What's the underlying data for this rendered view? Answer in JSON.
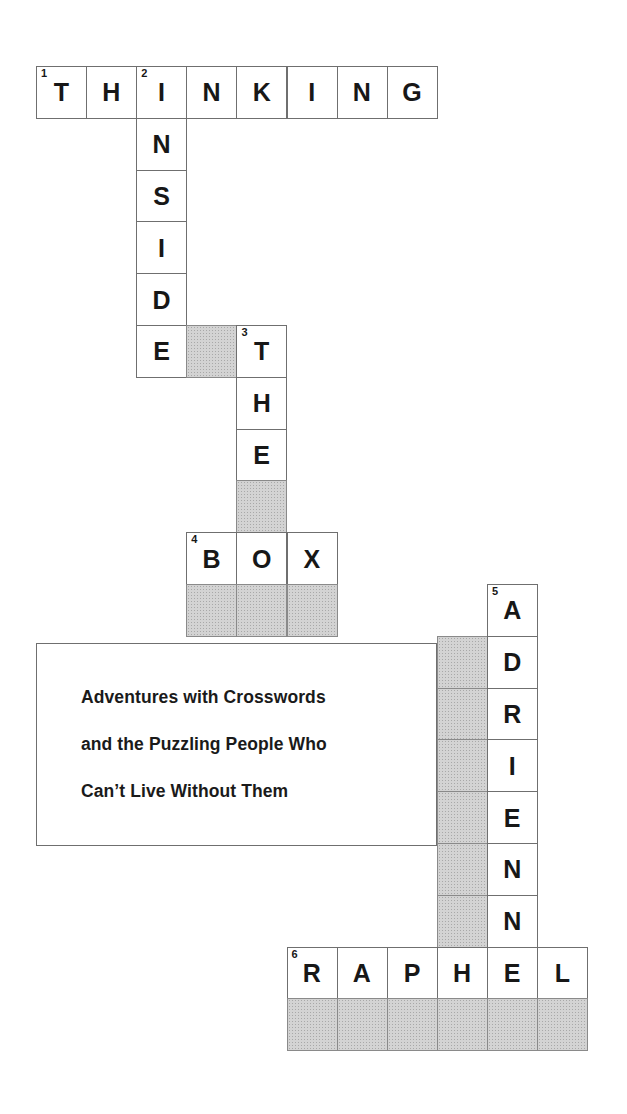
{
  "puzzle": {
    "title_answer_across_1": "THINKING",
    "geometry": {
      "origin_x": 36,
      "origin_y": 66,
      "col_width": 50.1,
      "row_height": 51.8
    },
    "entries": [
      {
        "number": "1",
        "direction": "across",
        "answer": "THINKING",
        "row": 0,
        "col": 0
      },
      {
        "number": "2",
        "direction": "down",
        "answer": "INSIDE",
        "row": 0,
        "col": 2
      },
      {
        "number": "3",
        "direction": "down",
        "answer": "THE",
        "row": 5,
        "col": 4
      },
      {
        "number": "4",
        "direction": "across",
        "answer": "BOX",
        "row": 9,
        "col": 3
      },
      {
        "number": "5",
        "direction": "down",
        "answer": "ADRIENN",
        "row": 10,
        "col": 9
      },
      {
        "number": "6",
        "direction": "across",
        "answer": "RAPHEL",
        "row": 17,
        "col": 5
      }
    ],
    "cells": [
      {
        "row": 0,
        "col": 0,
        "letter": "T",
        "number": "1",
        "shaded": false
      },
      {
        "row": 0,
        "col": 1,
        "letter": "H",
        "number": "",
        "shaded": false
      },
      {
        "row": 0,
        "col": 2,
        "letter": "I",
        "number": "2",
        "shaded": false
      },
      {
        "row": 0,
        "col": 3,
        "letter": "N",
        "number": "",
        "shaded": false
      },
      {
        "row": 0,
        "col": 4,
        "letter": "K",
        "number": "",
        "shaded": false
      },
      {
        "row": 0,
        "col": 5,
        "letter": "I",
        "number": "",
        "shaded": false
      },
      {
        "row": 0,
        "col": 6,
        "letter": "N",
        "number": "",
        "shaded": false
      },
      {
        "row": 0,
        "col": 7,
        "letter": "G",
        "number": "",
        "shaded": false
      },
      {
        "row": 1,
        "col": 2,
        "letter": "N",
        "number": "",
        "shaded": false
      },
      {
        "row": 2,
        "col": 2,
        "letter": "S",
        "number": "",
        "shaded": false
      },
      {
        "row": 3,
        "col": 2,
        "letter": "I",
        "number": "",
        "shaded": false
      },
      {
        "row": 4,
        "col": 2,
        "letter": "D",
        "number": "",
        "shaded": false
      },
      {
        "row": 5,
        "col": 2,
        "letter": "E",
        "number": "",
        "shaded": false
      },
      {
        "row": 5,
        "col": 3,
        "letter": "",
        "number": "",
        "shaded": true
      },
      {
        "row": 5,
        "col": 4,
        "letter": "T",
        "number": "3",
        "shaded": false
      },
      {
        "row": 6,
        "col": 4,
        "letter": "H",
        "number": "",
        "shaded": false
      },
      {
        "row": 7,
        "col": 4,
        "letter": "E",
        "number": "",
        "shaded": false
      },
      {
        "row": 8,
        "col": 4,
        "letter": "",
        "number": "",
        "shaded": true
      },
      {
        "row": 9,
        "col": 3,
        "letter": "B",
        "number": "4",
        "shaded": false
      },
      {
        "row": 9,
        "col": 4,
        "letter": "O",
        "number": "",
        "shaded": false
      },
      {
        "row": 9,
        "col": 5,
        "letter": "X",
        "number": "",
        "shaded": false
      },
      {
        "row": 10,
        "col": 3,
        "letter": "",
        "number": "",
        "shaded": true
      },
      {
        "row": 10,
        "col": 4,
        "letter": "",
        "number": "",
        "shaded": true
      },
      {
        "row": 10,
        "col": 5,
        "letter": "",
        "number": "",
        "shaded": true
      },
      {
        "row": 10,
        "col": 9,
        "letter": "A",
        "number": "5",
        "shaded": false
      },
      {
        "row": 11,
        "col": 8,
        "letter": "",
        "number": "",
        "shaded": true
      },
      {
        "row": 11,
        "col": 9,
        "letter": "D",
        "number": "",
        "shaded": false
      },
      {
        "row": 12,
        "col": 8,
        "letter": "",
        "number": "",
        "shaded": true
      },
      {
        "row": 12,
        "col": 9,
        "letter": "R",
        "number": "",
        "shaded": false
      },
      {
        "row": 13,
        "col": 8,
        "letter": "",
        "number": "",
        "shaded": true
      },
      {
        "row": 13,
        "col": 9,
        "letter": "I",
        "number": "",
        "shaded": false
      },
      {
        "row": 14,
        "col": 8,
        "letter": "",
        "number": "",
        "shaded": true
      },
      {
        "row": 14,
        "col": 9,
        "letter": "E",
        "number": "",
        "shaded": false
      },
      {
        "row": 15,
        "col": 8,
        "letter": "",
        "number": "",
        "shaded": true
      },
      {
        "row": 15,
        "col": 9,
        "letter": "N",
        "number": "",
        "shaded": false
      },
      {
        "row": 16,
        "col": 8,
        "letter": "",
        "number": "",
        "shaded": true
      },
      {
        "row": 16,
        "col": 9,
        "letter": "N",
        "number": "",
        "shaded": false
      },
      {
        "row": 17,
        "col": 5,
        "letter": "R",
        "number": "6",
        "shaded": false
      },
      {
        "row": 17,
        "col": 6,
        "letter": "A",
        "number": "",
        "shaded": false
      },
      {
        "row": 17,
        "col": 7,
        "letter": "P",
        "number": "",
        "shaded": false
      },
      {
        "row": 17,
        "col": 8,
        "letter": "H",
        "number": "",
        "shaded": false
      },
      {
        "row": 17,
        "col": 9,
        "letter": "E",
        "number": "",
        "shaded": false
      },
      {
        "row": 17,
        "col": 10,
        "letter": "L",
        "number": "",
        "shaded": false
      },
      {
        "row": 18,
        "col": 5,
        "letter": "",
        "number": "",
        "shaded": true
      },
      {
        "row": 18,
        "col": 6,
        "letter": "",
        "number": "",
        "shaded": true
      },
      {
        "row": 18,
        "col": 7,
        "letter": "",
        "number": "",
        "shaded": true
      },
      {
        "row": 18,
        "col": 8,
        "letter": "",
        "number": "",
        "shaded": true
      },
      {
        "row": 18,
        "col": 9,
        "letter": "",
        "number": "",
        "shaded": true
      },
      {
        "row": 18,
        "col": 10,
        "letter": "",
        "number": "",
        "shaded": true
      }
    ]
  },
  "subtitle": {
    "box": {
      "x": 36,
      "y": 643,
      "width": 401,
      "height": 203
    },
    "lines": [
      "Adventures with Crosswords",
      "and the Puzzling People Who",
      "Can’t Live Without Them"
    ]
  },
  "colors": {
    "page_background": "#ffffff",
    "cell_fill": "#ffffff",
    "cell_border": "#6f6f6f",
    "shaded_fill": "#d3d3d3",
    "text": "#171717"
  }
}
